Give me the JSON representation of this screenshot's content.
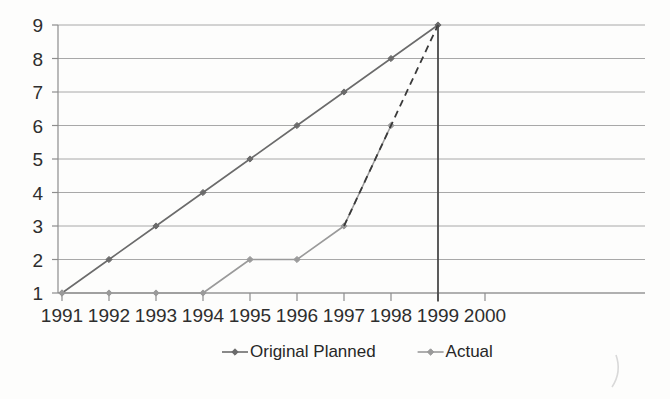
{
  "chart_data": {
    "type": "line",
    "title": "",
    "subtitle": "",
    "xlabel": "",
    "ylabel": "",
    "x": [
      1991,
      1992,
      1993,
      1994,
      1995,
      1996,
      1997,
      1998,
      1999,
      2000
    ],
    "categories": [
      "1991",
      "1992",
      "1993",
      "1994",
      "1995",
      "1996",
      "1997",
      "1998",
      "1999",
      "2000"
    ],
    "xlim": [
      1991,
      2000
    ],
    "ylim": [
      1,
      9
    ],
    "ytick_labels": [
      "9",
      "8",
      "7",
      "6",
      "5",
      "4",
      "3",
      "2",
      "1"
    ],
    "yticks": [
      9,
      8,
      7,
      6,
      5,
      4,
      3,
      2,
      1
    ],
    "grid": "horizontal",
    "legend_position": "bottom-center",
    "series": [
      {
        "name": "Original Planned",
        "color": "#6b6b6b",
        "style": "solid",
        "marker": "diamond",
        "x": [
          1991,
          1992,
          1993,
          1994,
          1995,
          1996,
          1997,
          1998,
          1999
        ],
        "values": [
          1,
          2,
          3,
          4,
          5,
          6,
          7,
          8,
          9
        ]
      },
      {
        "name": "Actual",
        "color": "#9a9a9a",
        "style": "solid",
        "marker": "diamond",
        "x": [
          1991,
          1992,
          1993,
          1994,
          1995,
          1996,
          1997,
          1998
        ],
        "values": [
          1,
          1,
          1,
          1,
          2,
          2,
          3,
          6
        ]
      }
    ],
    "annotations": [
      {
        "name": "projection-dashed-line",
        "style": "dashed",
        "color": "#3a3a3a",
        "x": [
          1997,
          1999
        ],
        "values": [
          3,
          9
        ]
      },
      {
        "name": "milestone-vertical-line",
        "style": "solid",
        "color": "#4a4a4a",
        "at_x": 1999,
        "from_value": 9,
        "to_value": 0.75
      }
    ]
  },
  "legend": {
    "items": [
      {
        "label": "Original Planned",
        "color": "#6b6b6b"
      },
      {
        "label": "Actual",
        "color": "#9a9a9a"
      }
    ]
  },
  "axis": {
    "y_labels": [
      "9",
      "8",
      "7",
      "6",
      "5",
      "4",
      "3",
      "2",
      "1"
    ],
    "x_labels": [
      "1991",
      "1992",
      "1993",
      "1994",
      "1995",
      "1996",
      "1997",
      "1998",
      "1999",
      "2000"
    ]
  },
  "colors": {
    "background": "#fdfdfc",
    "grid": "#a8a8a8",
    "axis": "#8d8d8d",
    "planned": "#6b6b6b",
    "actual": "#9a9a9a",
    "dashed": "#3a3a3a",
    "text": "#2e2e2e"
  }
}
